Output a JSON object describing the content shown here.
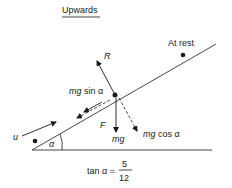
{
  "title": "Upwards",
  "labels": {
    "at_rest": "At rest",
    "reaction": "R",
    "mg_sin_prefix": "mg",
    "mg_sin_suffix": " sin α",
    "friction": "F",
    "weight": "mg",
    "mg_cos_prefix": "mg",
    "mg_cos_suffix": " cos α",
    "initial_velocity": "u",
    "angle": "α"
  },
  "equation": {
    "lhs": "tan α =",
    "numerator": "5",
    "denominator": "12"
  },
  "colors": {
    "ink": "#1a1a1a",
    "background": "#ffffff"
  }
}
